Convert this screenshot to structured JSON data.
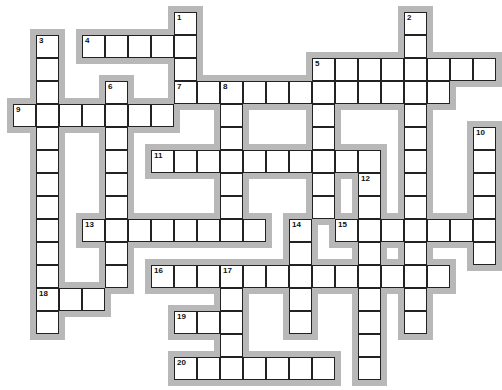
{
  "puzzle": {
    "cell_size": 23,
    "origin_x": 13,
    "origin_y": 12,
    "colors": {
      "cell_border": "#222222",
      "shadow": "#b8b8b8",
      "background": "#ffffff"
    },
    "entries": [
      {
        "number": "1",
        "direction": "down",
        "row": 0,
        "col": 7,
        "length": 4
      },
      {
        "number": "2",
        "direction": "down",
        "row": 0,
        "col": 17,
        "length": 14
      },
      {
        "number": "3",
        "direction": "down",
        "row": 1,
        "col": 1,
        "length": 13
      },
      {
        "number": "4",
        "direction": "across",
        "row": 1,
        "col": 3,
        "length": 5
      },
      {
        "number": "5",
        "direction": "across",
        "row": 2,
        "col": 13,
        "length": 8
      },
      {
        "number": "5",
        "direction": "down",
        "row": 2,
        "col": 13,
        "length": 7
      },
      {
        "number": "6",
        "direction": "down",
        "row": 3,
        "col": 4,
        "length": 9
      },
      {
        "number": "7",
        "direction": "across",
        "row": 3,
        "col": 7,
        "length": 12
      },
      {
        "number": "8",
        "direction": "down",
        "row": 3,
        "col": 9,
        "length": 7
      },
      {
        "number": "9",
        "direction": "across",
        "row": 4,
        "col": 0,
        "length": 7
      },
      {
        "number": "10",
        "direction": "down",
        "row": 5,
        "col": 20,
        "length": 6
      },
      {
        "number": "11",
        "direction": "across",
        "row": 6,
        "col": 6,
        "length": 10
      },
      {
        "number": "12",
        "direction": "down",
        "row": 7,
        "col": 15,
        "length": 9
      },
      {
        "number": "13",
        "direction": "across",
        "row": 9,
        "col": 3,
        "length": 8
      },
      {
        "number": "14",
        "direction": "down",
        "row": 9,
        "col": 12,
        "length": 5
      },
      {
        "number": "15",
        "direction": "across",
        "row": 9,
        "col": 14,
        "length": 7
      },
      {
        "number": "16",
        "direction": "across",
        "row": 11,
        "col": 6,
        "length": 13
      },
      {
        "number": "17",
        "direction": "down",
        "row": 11,
        "col": 9,
        "length": 5
      },
      {
        "number": "18",
        "direction": "across",
        "row": 12,
        "col": 1,
        "length": 3
      },
      {
        "number": "19",
        "direction": "across",
        "row": 13,
        "col": 7,
        "length": 3
      },
      {
        "number": "20",
        "direction": "across",
        "row": 15,
        "col": 7,
        "length": 7
      }
    ]
  }
}
